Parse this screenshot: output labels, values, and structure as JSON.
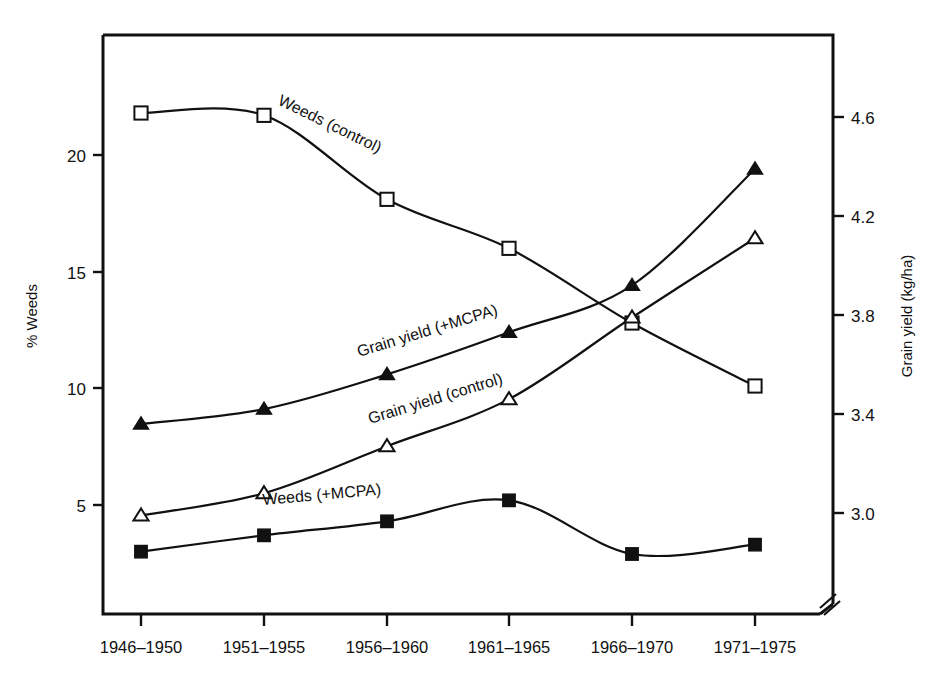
{
  "chart_data": {
    "type": "line",
    "title": "",
    "subtitle": "",
    "xlabel": "",
    "ylabel": "% Weeds",
    "y2label": "Grain yield (kg/ha)",
    "grid": false,
    "legend_position": "inline-labels",
    "axis_break_bottom_right": true,
    "categories": [
      "1946–1950",
      "1951–1955",
      "1956–1960",
      "1961–1965",
      "1966–1970",
      "1971–1975"
    ],
    "yticks": [
      "5",
      "10",
      "15",
      "20"
    ],
    "ytick_values": [
      5,
      10,
      15,
      20
    ],
    "ylim": [
      1.5,
      23.5
    ],
    "y2ticks": [
      "3.0",
      "3.4",
      "3.8",
      "4.2",
      "4.6"
    ],
    "y2tick_values": [
      3.0,
      3.4,
      3.8,
      4.2,
      4.6
    ],
    "y2lim": [
      2.78,
      4.75
    ],
    "series": [
      {
        "name": "Weeds (control)",
        "axis": "left",
        "marker": "open-square",
        "values": [
          21.8,
          21.7,
          18.1,
          16.0,
          12.8,
          10.1
        ]
      },
      {
        "name": "Weeds (+MCPA)",
        "axis": "left",
        "marker": "filled-square",
        "values": [
          3.0,
          3.7,
          4.3,
          5.2,
          2.9,
          3.3
        ]
      },
      {
        "name": "Grain yield (+MCPA)",
        "axis": "right",
        "marker": "filled-triangle",
        "values": [
          3.36,
          3.42,
          3.56,
          3.73,
          3.92,
          4.39
        ]
      },
      {
        "name": "Grain yield (control)",
        "axis": "right",
        "marker": "open-triangle",
        "values": [
          2.99,
          3.08,
          3.27,
          3.46,
          3.79,
          4.11
        ]
      }
    ],
    "annotations": [
      {
        "text": "Weeds (control)",
        "near_series": "Weeds (control)"
      },
      {
        "text": "Grain yield (+MCPA)",
        "near_series": "Grain yield (+MCPA)"
      },
      {
        "text": "Grain yield (control)",
        "near_series": "Grain yield (control)"
      },
      {
        "text": "Weeds (+MCPA)",
        "near_series": "Weeds (+MCPA)"
      }
    ],
    "colors": {
      "line": "#111111",
      "background": "#ffffff",
      "marker_fill": "#111111",
      "marker_open": "#ffffff"
    }
  }
}
